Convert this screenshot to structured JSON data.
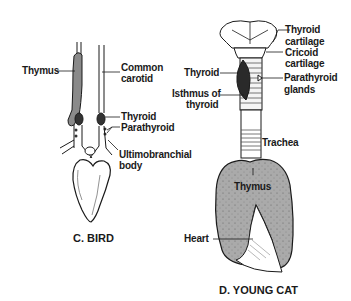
{
  "panels": [
    {
      "id": "bird",
      "caption": "C. BIRD",
      "labels": {
        "thymus": "Thymus",
        "common_carotid_1": "Common",
        "common_carotid_2": "carotid",
        "thyroid": "Thyroid",
        "parathyroid": "Parathyroid",
        "ultimobranchial_1": "Ultimobranchial",
        "ultimobranchial_2": "body"
      }
    },
    {
      "id": "young-cat",
      "caption": "D. YOUNG CAT",
      "labels": {
        "thyroid_cartilage_1": "Thyroid",
        "thyroid_cartilage_2": "cartilage",
        "cricoid_cartilage_1": "Cricoid",
        "cricoid_cartilage_2": "cartilage",
        "thyroid": "Thyroid",
        "parathyroid_glands_1": "Parathyroid",
        "parathyroid_glands_2": "glands",
        "isthmus_1": "Isthmus of",
        "isthmus_2": "thyroid",
        "trachea": "Trachea",
        "thymus": "Thymus",
        "heart": "Heart"
      }
    }
  ],
  "colors": {
    "ink": "#1a1a1a",
    "thymus_fill": "#a8a8a8",
    "bird_thymus_fill": "#8a8a8a"
  }
}
